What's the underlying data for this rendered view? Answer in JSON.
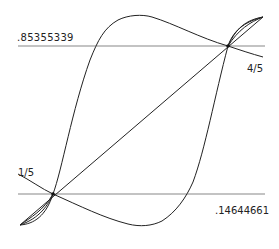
{
  "diagram": {
    "title": "",
    "labels": {
      "upper_value": ".85355339",
      "lower_value": ".14644661",
      "fixed_point_low": "1/5",
      "fixed_point_high": "4/5"
    },
    "colors": {
      "background": "#ffffff",
      "curve": "#222222",
      "guide_line": "#777777"
    },
    "guide_lines": [
      {
        "name": "upper",
        "y_value": 0.85355339
      },
      {
        "name": "lower",
        "y_value": 0.14644661
      }
    ],
    "fixed_points": [
      {
        "label": "1/5",
        "x": 0.2
      },
      {
        "label": "4/5",
        "x": 0.8
      }
    ],
    "curves": [
      {
        "name": "identity-diagonal"
      },
      {
        "name": "rising-s-curve"
      },
      {
        "name": "falling-s-curve"
      },
      {
        "name": "lower-lens-loop"
      },
      {
        "name": "upper-lens-loop"
      }
    ]
  }
}
